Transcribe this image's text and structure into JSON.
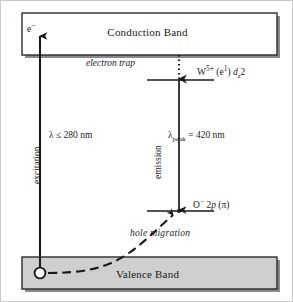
{
  "figure": {
    "type": "energy-band-photoluminescence-diagram",
    "bands": {
      "conduction": {
        "label": "Conduction Band",
        "fill": "#ffffff",
        "stroke": "#2b2b2b"
      },
      "valence": {
        "label": "Valence Band",
        "fill": "#cfcfcf",
        "stroke": "#2b2b2b"
      }
    },
    "carriers": {
      "electron_symbol": "e",
      "electron_charge": "−",
      "hole_marker": "open-circle"
    },
    "levels": [
      {
        "name": "electron-trap-level",
        "annotation": "electron trap",
        "label_main": "W",
        "label_charge": "5+",
        "label_config_open": " (e",
        "label_config_sup": "1",
        "label_config_close": ") ",
        "label_orbital": "d",
        "label_orbital_sub": "z",
        "label_orbital_sup": "2"
      },
      {
        "name": "oxygen-2p-level",
        "label_main": "O",
        "label_charge": "−",
        "label_orbital_pre": " 2",
        "label_orbital": "p",
        "label_orbital_post": " (π)"
      }
    ],
    "processes": [
      {
        "name": "excitation",
        "rotated_label": "excitation",
        "wavelength_label": "λ ≤ 280 nm",
        "arrow": "solid-up"
      },
      {
        "name": "emission",
        "rotated_label": "emission",
        "wavelength_symbol": "λ",
        "wavelength_sub": "peak",
        "wavelength_value": " =  420 nm",
        "arrow": "solid-down"
      },
      {
        "name": "electron-trapping",
        "arrow": "dotted-down"
      },
      {
        "name": "hole-migration",
        "label": "hole  migration",
        "arrow": "dashed-up"
      }
    ],
    "colors": {
      "line": "#1a1a1a",
      "valence_fill": "#cfcfcf",
      "shadow": "#808080",
      "frame": "#c9c9c9"
    }
  }
}
